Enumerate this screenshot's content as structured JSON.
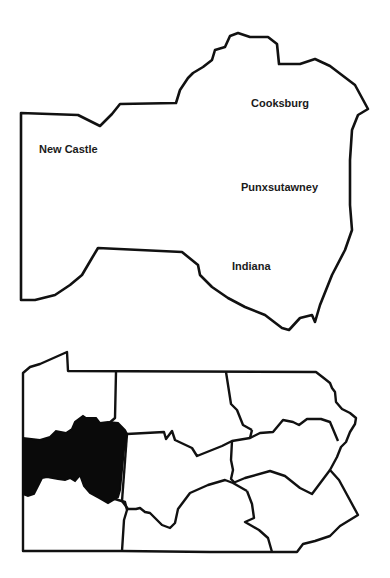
{
  "detail_map": {
    "region": "Western Pennsylvania study area",
    "labels": [
      {
        "name": "Cooksburg",
        "x": 251,
        "y": 98
      },
      {
        "name": "New Castle",
        "x": 39,
        "y": 144
      },
      {
        "name": "Punxsutawney",
        "x": 241,
        "y": 182
      },
      {
        "name": "Indiana",
        "x": 232,
        "y": 261
      }
    ]
  },
  "locator_map": {
    "state": "Pennsylvania",
    "highlighted_region": "western region",
    "highlight_color": "#000000",
    "outline_color": "#111111"
  }
}
